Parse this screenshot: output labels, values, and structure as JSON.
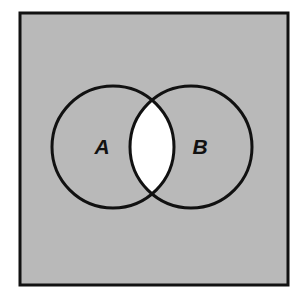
{
  "figure": {
    "canvas": {
      "width": 300,
      "height": 300,
      "background": "#ffffff"
    },
    "frame": {
      "name": "universal-set-rectangle",
      "x": 20,
      "y": 13,
      "width": 268,
      "height": 272,
      "fill_color": "#b9b9b9",
      "stroke_color": "#111111",
      "stroke_width": 3
    },
    "circles": [
      {
        "label": "A",
        "name": "set-a-circle",
        "cx": 113,
        "cy": 147,
        "r": 61,
        "stroke_color": "#111111",
        "stroke_width": 3,
        "fill_color": "#b9b9b9"
      },
      {
        "label": "B",
        "name": "set-b-circle",
        "cx": 191,
        "cy": 147,
        "r": 61,
        "stroke_color": "#111111",
        "stroke_width": 3,
        "fill_color": "#b9b9b9"
      }
    ],
    "intersection": {
      "name": "intersection-region",
      "label": "",
      "fill_color": "#ffffff",
      "shaded": false,
      "top_crossing": {
        "x": 152,
        "y": 103
      },
      "bottom_crossing": {
        "x": 152,
        "y": 192
      }
    },
    "labels": [
      {
        "text": "A",
        "x": 102,
        "y": 154
      },
      {
        "text": "B",
        "x": 200,
        "y": 154
      }
    ]
  }
}
